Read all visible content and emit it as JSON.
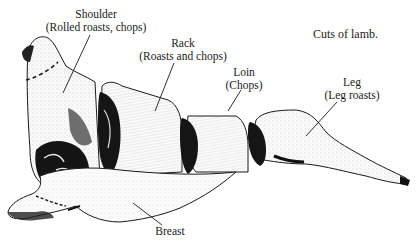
{
  "figure": {
    "caption": "Cuts of lamb.",
    "cuts": [
      {
        "name": "Shoulder",
        "use": "(Rolled roasts, chops)"
      },
      {
        "name": "Rack",
        "use": "(Roasts and chops)"
      },
      {
        "name": "Loin",
        "use": "(Chops)"
      },
      {
        "name": "Leg",
        "use": "(Leg roasts)"
      },
      {
        "name": "Breast",
        "use": ""
      }
    ]
  },
  "colors": {
    "ink": "#1a1a1a",
    "paper": "#ffffff",
    "meat_light": "#f4f4f4",
    "meat_dark": "#111111"
  }
}
